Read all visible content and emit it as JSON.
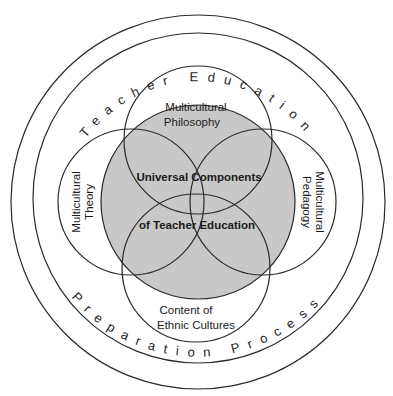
{
  "diagram": {
    "outer_ring": {
      "top_text": "Teacher Education",
      "bottom_text": "Preparation Process"
    },
    "core": {
      "line1": "Universal Components",
      "line2": "of Teacher Education",
      "fill_color": "#c8c8c8"
    },
    "components": {
      "top": {
        "line1": "Multicultural",
        "line2": "Philosophy"
      },
      "left": {
        "line1": "Multicultural",
        "line2": "Theory"
      },
      "right": {
        "line1": "Multicultural",
        "line2": "Pedagogy"
      },
      "bottom": {
        "line1": "Content of",
        "line2": "Ethnic Cultures"
      }
    }
  }
}
